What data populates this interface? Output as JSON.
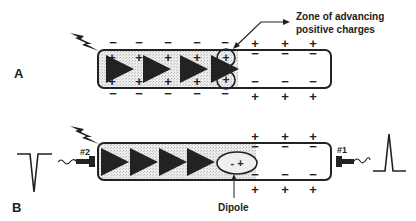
{
  "panels": {
    "a": {
      "label": "A"
    },
    "b": {
      "label": "B"
    }
  },
  "annotations": {
    "zone_line1": "Zone of advancing",
    "zone_line2": "positive charges",
    "dipole": "Dipole",
    "dipole_charges": "- +",
    "electrode_1": "#1",
    "electrode_2": "#2"
  },
  "symbols": {
    "plus": "+",
    "minus": "−"
  },
  "colors": {
    "stroke": "#222222",
    "fill_depolarized": "#e4e4e4",
    "background": "#ffffff"
  }
}
